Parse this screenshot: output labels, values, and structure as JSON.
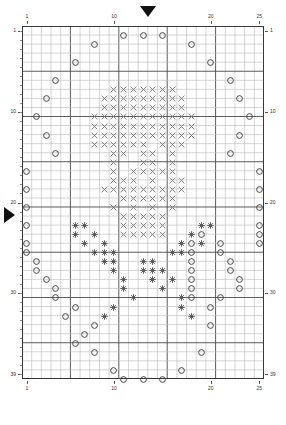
{
  "chart_data": {
    "type": "heatmap",
    "xlabel": "Stitches",
    "ylabel": "Rows",
    "columns": 25,
    "rows": 39,
    "grid": true,
    "bold_every": 5,
    "x_tick_labels": [
      "1",
      "10",
      "20",
      "25"
    ],
    "x_tick_values": [
      1,
      10,
      20,
      25
    ],
    "y_tick_labels": [
      "1",
      "10",
      "20",
      "30",
      "39"
    ],
    "y_tick_values": [
      1,
      10,
      20,
      30,
      39
    ],
    "legend": [
      {
        "symbol": "circle",
        "name": "yarn-over"
      },
      {
        "symbol": "cross",
        "name": "decrease-cross"
      },
      {
        "symbol": "asterisk",
        "name": "cluster-asterisk"
      }
    ],
    "markers": [
      {
        "name": "center-column-marker",
        "orientation": "down",
        "column": 13
      },
      {
        "name": "center-row-marker",
        "orientation": "right",
        "row": 20
      }
    ],
    "symbol_colors": {
      "circle": "#444444",
      "cross": "#777777",
      "asterisk": "#555555",
      "gridline": "#b9b9b9",
      "gridline_bold": "#4a4a4a",
      "border": "#2e2e2e"
    },
    "cells": [
      {
        "r": 1,
        "c": 11,
        "s": "circle"
      },
      {
        "r": 1,
        "c": 13,
        "s": "circle"
      },
      {
        "r": 1,
        "c": 15,
        "s": "circle"
      },
      {
        "r": 2,
        "c": 8,
        "s": "circle"
      },
      {
        "r": 2,
        "c": 18,
        "s": "circle"
      },
      {
        "r": 4,
        "c": 6,
        "s": "circle"
      },
      {
        "r": 4,
        "c": 20,
        "s": "circle"
      },
      {
        "r": 6,
        "c": 4,
        "s": "circle"
      },
      {
        "r": 6,
        "c": 22,
        "s": "circle"
      },
      {
        "r": 7,
        "c": 10,
        "s": "cross"
      },
      {
        "r": 7,
        "c": 11,
        "s": "cross"
      },
      {
        "r": 7,
        "c": 12,
        "s": "cross"
      },
      {
        "r": 7,
        "c": 13,
        "s": "cross"
      },
      {
        "r": 7,
        "c": 14,
        "s": "cross"
      },
      {
        "r": 7,
        "c": 15,
        "s": "cross"
      },
      {
        "r": 7,
        "c": 16,
        "s": "cross"
      },
      {
        "r": 8,
        "c": 3,
        "s": "circle"
      },
      {
        "r": 8,
        "c": 23,
        "s": "circle"
      },
      {
        "r": 8,
        "c": 9,
        "s": "cross"
      },
      {
        "r": 8,
        "c": 10,
        "s": "cross"
      },
      {
        "r": 8,
        "c": 11,
        "s": "cross"
      },
      {
        "r": 8,
        "c": 12,
        "s": "cross"
      },
      {
        "r": 8,
        "c": 13,
        "s": "cross"
      },
      {
        "r": 8,
        "c": 14,
        "s": "cross"
      },
      {
        "r": 8,
        "c": 15,
        "s": "cross"
      },
      {
        "r": 8,
        "c": 16,
        "s": "cross"
      },
      {
        "r": 8,
        "c": 17,
        "s": "cross"
      },
      {
        "r": 9,
        "c": 9,
        "s": "cross"
      },
      {
        "r": 9,
        "c": 10,
        "s": "cross"
      },
      {
        "r": 9,
        "c": 11,
        "s": "cross"
      },
      {
        "r": 9,
        "c": 12,
        "s": "cross"
      },
      {
        "r": 9,
        "c": 13,
        "s": "cross"
      },
      {
        "r": 9,
        "c": 14,
        "s": "cross"
      },
      {
        "r": 9,
        "c": 15,
        "s": "cross"
      },
      {
        "r": 9,
        "c": 16,
        "s": "cross"
      },
      {
        "r": 9,
        "c": 17,
        "s": "cross"
      },
      {
        "r": 10,
        "c": 2,
        "s": "circle"
      },
      {
        "r": 10,
        "c": 24,
        "s": "circle"
      },
      {
        "r": 10,
        "c": 8,
        "s": "cross"
      },
      {
        "r": 10,
        "c": 9,
        "s": "cross"
      },
      {
        "r": 10,
        "c": 10,
        "s": "cross"
      },
      {
        "r": 10,
        "c": 11,
        "s": "cross"
      },
      {
        "r": 10,
        "c": 12,
        "s": "cross"
      },
      {
        "r": 10,
        "c": 13,
        "s": "cross"
      },
      {
        "r": 10,
        "c": 14,
        "s": "cross"
      },
      {
        "r": 10,
        "c": 15,
        "s": "cross"
      },
      {
        "r": 10,
        "c": 16,
        "s": "cross"
      },
      {
        "r": 10,
        "c": 17,
        "s": "cross"
      },
      {
        "r": 10,
        "c": 18,
        "s": "cross"
      },
      {
        "r": 11,
        "c": 8,
        "s": "cross"
      },
      {
        "r": 11,
        "c": 9,
        "s": "cross"
      },
      {
        "r": 11,
        "c": 10,
        "s": "cross"
      },
      {
        "r": 11,
        "c": 11,
        "s": "cross"
      },
      {
        "r": 11,
        "c": 12,
        "s": "cross"
      },
      {
        "r": 11,
        "c": 13,
        "s": "cross"
      },
      {
        "r": 11,
        "c": 14,
        "s": "cross"
      },
      {
        "r": 11,
        "c": 15,
        "s": "cross"
      },
      {
        "r": 11,
        "c": 16,
        "s": "cross"
      },
      {
        "r": 11,
        "c": 17,
        "s": "cross"
      },
      {
        "r": 11,
        "c": 18,
        "s": "cross"
      },
      {
        "r": 12,
        "c": 3,
        "s": "circle"
      },
      {
        "r": 12,
        "c": 23,
        "s": "circle"
      },
      {
        "r": 12,
        "c": 8,
        "s": "cross"
      },
      {
        "r": 12,
        "c": 9,
        "s": "cross"
      },
      {
        "r": 12,
        "c": 10,
        "s": "cross"
      },
      {
        "r": 12,
        "c": 11,
        "s": "cross"
      },
      {
        "r": 12,
        "c": 12,
        "s": "cross"
      },
      {
        "r": 12,
        "c": 13,
        "s": "cross"
      },
      {
        "r": 12,
        "c": 14,
        "s": "cross"
      },
      {
        "r": 12,
        "c": 15,
        "s": "cross"
      },
      {
        "r": 12,
        "c": 16,
        "s": "cross"
      },
      {
        "r": 12,
        "c": 17,
        "s": "cross"
      },
      {
        "r": 12,
        "c": 18,
        "s": "cross"
      },
      {
        "r": 13,
        "c": 8,
        "s": "cross"
      },
      {
        "r": 13,
        "c": 9,
        "s": "cross"
      },
      {
        "r": 13,
        "c": 10,
        "s": "cross"
      },
      {
        "r": 13,
        "c": 11,
        "s": "cross"
      },
      {
        "r": 13,
        "c": 12,
        "s": "cross"
      },
      {
        "r": 13,
        "c": 13,
        "s": "cross"
      },
      {
        "r": 13,
        "c": 15,
        "s": "cross"
      },
      {
        "r": 13,
        "c": 16,
        "s": "cross"
      },
      {
        "r": 13,
        "c": 17,
        "s": "cross"
      },
      {
        "r": 14,
        "c": 4,
        "s": "circle"
      },
      {
        "r": 14,
        "c": 22,
        "s": "circle"
      },
      {
        "r": 14,
        "c": 10,
        "s": "cross"
      },
      {
        "r": 14,
        "c": 11,
        "s": "cross"
      },
      {
        "r": 14,
        "c": 13,
        "s": "cross"
      },
      {
        "r": 14,
        "c": 14,
        "s": "cross"
      },
      {
        "r": 14,
        "c": 16,
        "s": "cross"
      },
      {
        "r": 15,
        "c": 10,
        "s": "cross"
      },
      {
        "r": 15,
        "c": 13,
        "s": "cross"
      },
      {
        "r": 15,
        "c": 14,
        "s": "cross"
      },
      {
        "r": 15,
        "c": 16,
        "s": "cross"
      },
      {
        "r": 16,
        "c": 1,
        "s": "circle"
      },
      {
        "r": 16,
        "c": 25,
        "s": "circle"
      },
      {
        "r": 16,
        "c": 10,
        "s": "cross"
      },
      {
        "r": 16,
        "c": 12,
        "s": "cross"
      },
      {
        "r": 16,
        "c": 13,
        "s": "cross"
      },
      {
        "r": 16,
        "c": 14,
        "s": "cross"
      },
      {
        "r": 16,
        "c": 15,
        "s": "cross"
      },
      {
        "r": 16,
        "c": 16,
        "s": "cross"
      },
      {
        "r": 17,
        "c": 10,
        "s": "cross"
      },
      {
        "r": 17,
        "c": 11,
        "s": "cross"
      },
      {
        "r": 17,
        "c": 12,
        "s": "cross"
      },
      {
        "r": 17,
        "c": 14,
        "s": "cross"
      },
      {
        "r": 17,
        "c": 16,
        "s": "cross"
      },
      {
        "r": 17,
        "c": 17,
        "s": "cross"
      },
      {
        "r": 18,
        "c": 1,
        "s": "circle"
      },
      {
        "r": 18,
        "c": 25,
        "s": "circle"
      },
      {
        "r": 18,
        "c": 9,
        "s": "cross"
      },
      {
        "r": 18,
        "c": 10,
        "s": "cross"
      },
      {
        "r": 18,
        "c": 11,
        "s": "cross"
      },
      {
        "r": 18,
        "c": 12,
        "s": "cross"
      },
      {
        "r": 18,
        "c": 13,
        "s": "cross"
      },
      {
        "r": 18,
        "c": 14,
        "s": "cross"
      },
      {
        "r": 18,
        "c": 15,
        "s": "cross"
      },
      {
        "r": 18,
        "c": 16,
        "s": "cross"
      },
      {
        "r": 18,
        "c": 17,
        "s": "cross"
      },
      {
        "r": 19,
        "c": 11,
        "s": "cross"
      },
      {
        "r": 19,
        "c": 12,
        "s": "cross"
      },
      {
        "r": 19,
        "c": 13,
        "s": "cross"
      },
      {
        "r": 19,
        "c": 14,
        "s": "cross"
      },
      {
        "r": 19,
        "c": 15,
        "s": "cross"
      },
      {
        "r": 19,
        "c": 16,
        "s": "cross"
      },
      {
        "r": 20,
        "c": 1,
        "s": "circle"
      },
      {
        "r": 20,
        "c": 25,
        "s": "circle"
      },
      {
        "r": 20,
        "c": 10,
        "s": "cross"
      },
      {
        "r": 20,
        "c": 12,
        "s": "cross"
      },
      {
        "r": 20,
        "c": 14,
        "s": "cross"
      },
      {
        "r": 20,
        "c": 16,
        "s": "cross"
      },
      {
        "r": 21,
        "c": 11,
        "s": "cross"
      },
      {
        "r": 21,
        "c": 12,
        "s": "cross"
      },
      {
        "r": 21,
        "c": 13,
        "s": "cross"
      },
      {
        "r": 21,
        "c": 14,
        "s": "cross"
      },
      {
        "r": 21,
        "c": 15,
        "s": "cross"
      },
      {
        "r": 22,
        "c": 1,
        "s": "circle"
      },
      {
        "r": 22,
        "c": 25,
        "s": "circle"
      },
      {
        "r": 22,
        "c": 6,
        "s": "asterisk"
      },
      {
        "r": 22,
        "c": 7,
        "s": "asterisk"
      },
      {
        "r": 22,
        "c": 11,
        "s": "cross"
      },
      {
        "r": 22,
        "c": 12,
        "s": "cross"
      },
      {
        "r": 22,
        "c": 13,
        "s": "cross"
      },
      {
        "r": 22,
        "c": 14,
        "s": "cross"
      },
      {
        "r": 22,
        "c": 15,
        "s": "cross"
      },
      {
        "r": 22,
        "c": 19,
        "s": "asterisk"
      },
      {
        "r": 22,
        "c": 20,
        "s": "asterisk"
      },
      {
        "r": 23,
        "c": 6,
        "s": "asterisk"
      },
      {
        "r": 23,
        "c": 8,
        "s": "asterisk"
      },
      {
        "r": 23,
        "c": 11,
        "s": "cross"
      },
      {
        "r": 23,
        "c": 12,
        "s": "cross"
      },
      {
        "r": 23,
        "c": 13,
        "s": "cross"
      },
      {
        "r": 23,
        "c": 14,
        "s": "cross"
      },
      {
        "r": 23,
        "c": 15,
        "s": "cross"
      },
      {
        "r": 23,
        "c": 18,
        "s": "asterisk"
      },
      {
        "r": 23,
        "c": 19,
        "s": "circle"
      },
      {
        "r": 23,
        "c": 25,
        "s": "circle"
      },
      {
        "r": 24,
        "c": 1,
        "s": "circle"
      },
      {
        "r": 24,
        "c": 7,
        "s": "asterisk"
      },
      {
        "r": 24,
        "c": 9,
        "s": "asterisk"
      },
      {
        "r": 24,
        "c": 17,
        "s": "asterisk"
      },
      {
        "r": 24,
        "c": 18,
        "s": "circle"
      },
      {
        "r": 24,
        "c": 19,
        "s": "asterisk"
      },
      {
        "r": 24,
        "c": 21,
        "s": "circle"
      },
      {
        "r": 24,
        "c": 25,
        "s": "circle"
      },
      {
        "r": 25,
        "c": 1,
        "s": "circle"
      },
      {
        "r": 25,
        "c": 8,
        "s": "asterisk"
      },
      {
        "r": 25,
        "c": 9,
        "s": "asterisk"
      },
      {
        "r": 25,
        "c": 10,
        "s": "asterisk"
      },
      {
        "r": 25,
        "c": 16,
        "s": "asterisk"
      },
      {
        "r": 25,
        "c": 17,
        "s": "asterisk"
      },
      {
        "r": 25,
        "c": 18,
        "s": "circle"
      },
      {
        "r": 25,
        "c": 21,
        "s": "circle"
      },
      {
        "r": 26,
        "c": 9,
        "s": "asterisk"
      },
      {
        "r": 26,
        "c": 10,
        "s": "asterisk"
      },
      {
        "r": 26,
        "c": 13,
        "s": "asterisk"
      },
      {
        "r": 26,
        "c": 14,
        "s": "asterisk"
      },
      {
        "r": 26,
        "c": 18,
        "s": "circle"
      },
      {
        "r": 26,
        "c": 22,
        "s": "circle"
      },
      {
        "r": 26,
        "c": 2,
        "s": "circle"
      },
      {
        "r": 27,
        "c": 10,
        "s": "asterisk"
      },
      {
        "r": 27,
        "c": 13,
        "s": "asterisk"
      },
      {
        "r": 27,
        "c": 14,
        "s": "asterisk"
      },
      {
        "r": 27,
        "c": 15,
        "s": "asterisk"
      },
      {
        "r": 27,
        "c": 18,
        "s": "circle"
      },
      {
        "r": 27,
        "c": 22,
        "s": "circle"
      },
      {
        "r": 27,
        "c": 2,
        "s": "circle"
      },
      {
        "r": 28,
        "c": 11,
        "s": "asterisk"
      },
      {
        "r": 28,
        "c": 14,
        "s": "asterisk"
      },
      {
        "r": 28,
        "c": 16,
        "s": "asterisk"
      },
      {
        "r": 28,
        "c": 18,
        "s": "circle"
      },
      {
        "r": 28,
        "c": 23,
        "s": "circle"
      },
      {
        "r": 28,
        "c": 3,
        "s": "circle"
      },
      {
        "r": 29,
        "c": 11,
        "s": "asterisk"
      },
      {
        "r": 29,
        "c": 15,
        "s": "asterisk"
      },
      {
        "r": 29,
        "c": 18,
        "s": "circle"
      },
      {
        "r": 29,
        "c": 4,
        "s": "circle"
      },
      {
        "r": 29,
        "c": 23,
        "s": "circle"
      },
      {
        "r": 30,
        "c": 12,
        "s": "asterisk"
      },
      {
        "r": 30,
        "c": 17,
        "s": "asterisk"
      },
      {
        "r": 30,
        "c": 18,
        "s": "circle"
      },
      {
        "r": 30,
        "c": 4,
        "s": "circle"
      },
      {
        "r": 30,
        "c": 21,
        "s": "circle"
      },
      {
        "r": 31,
        "c": 10,
        "s": "asterisk"
      },
      {
        "r": 31,
        "c": 17,
        "s": "asterisk"
      },
      {
        "r": 31,
        "c": 20,
        "s": "circle"
      },
      {
        "r": 31,
        "c": 6,
        "s": "circle"
      },
      {
        "r": 32,
        "c": 9,
        "s": "asterisk"
      },
      {
        "r": 32,
        "c": 18,
        "s": "asterisk"
      },
      {
        "r": 32,
        "c": 5,
        "s": "circle"
      },
      {
        "r": 33,
        "c": 8,
        "s": "circle"
      },
      {
        "r": 33,
        "c": 20,
        "s": "circle"
      },
      {
        "r": 34,
        "c": 7,
        "s": "circle"
      },
      {
        "r": 35,
        "c": 6,
        "s": "circle"
      },
      {
        "r": 36,
        "c": 8,
        "s": "circle"
      },
      {
        "r": 36,
        "c": 19,
        "s": "circle"
      },
      {
        "r": 38,
        "c": 10,
        "s": "circle"
      },
      {
        "r": 38,
        "c": 17,
        "s": "circle"
      },
      {
        "r": 39,
        "c": 11,
        "s": "circle"
      },
      {
        "r": 39,
        "c": 13,
        "s": "circle"
      },
      {
        "r": 39,
        "c": 15,
        "s": "circle"
      }
    ]
  },
  "geometry": {
    "grid_left": 22,
    "grid_top": 26,
    "cell_w": 9.68,
    "cell_h": 9.05,
    "marker_down_x": 140,
    "marker_down_y": 6,
    "marker_right_x": 4,
    "marker_right_y": 207
  }
}
